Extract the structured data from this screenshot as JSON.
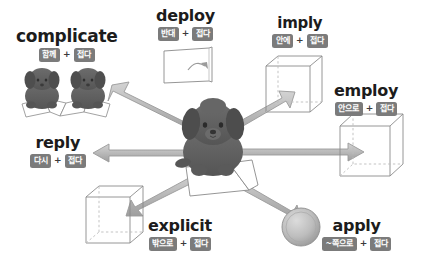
{
  "diagram": {
    "center": {
      "subject": "dog-on-folded-paper",
      "paper": "folded-paper-sheet"
    },
    "root_meaning": "접다",
    "colors": {
      "tag_background": "#7b7b7b",
      "tag_text": "#ffffff",
      "headword_text": "#1c1c1c",
      "arrow_fill": "#b4b4b4",
      "arrow_stroke": "#8f8f8f",
      "shape_stroke": "#8a8a8a",
      "dog_body": "#5f5f5f",
      "background": "#ffffff"
    },
    "words": [
      {
        "id": "complicate",
        "label": "complicate",
        "prefix_tag": "함께",
        "plus": "+",
        "root_tag": "접다",
        "icon": "two-dogs-on-accordion-folded-paper",
        "arrow_direction": "up-left"
      },
      {
        "id": "deploy",
        "label": "deploy",
        "prefix_tag": "반대",
        "plus": "+",
        "root_tag": "접다",
        "icon": "unfolding-sheet-with-curved-arrow",
        "arrow_direction": "none"
      },
      {
        "id": "imply",
        "label": "imply",
        "prefix_tag": "안에",
        "plus": "+",
        "root_tag": "접다",
        "icon": "wireframe-cube-with-inward-arrow",
        "arrow_direction": "up-right"
      },
      {
        "id": "employ",
        "label": "employ",
        "prefix_tag": "안으로",
        "plus": "+",
        "root_tag": "접다",
        "icon": "wireframe-cube-with-entering-arrow",
        "arrow_direction": "right"
      },
      {
        "id": "reply",
        "label": "reply",
        "prefix_tag": "다시",
        "plus": "+",
        "root_tag": "접다",
        "icon": "left-pointing-arrow",
        "arrow_direction": "left"
      },
      {
        "id": "explicit",
        "label": "explicit",
        "prefix_tag": "밖으로",
        "plus": "+",
        "root_tag": "접다",
        "icon": "wireframe-cube-with-outward-arrow",
        "arrow_direction": "down-left"
      },
      {
        "id": "apply",
        "label": "apply",
        "prefix_tag": "~쪽으로",
        "plus": "+",
        "root_tag": "접다",
        "icon": "sphere-with-incoming-arrow",
        "arrow_direction": "down-right"
      }
    ]
  }
}
